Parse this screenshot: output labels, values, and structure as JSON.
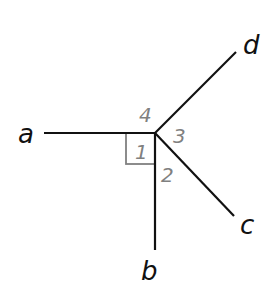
{
  "diagram": {
    "type": "angles-at-point",
    "vertex": {
      "x": 155,
      "y": 133
    },
    "rays": [
      {
        "id": "a",
        "label": "a",
        "end": {
          "x": 44,
          "y": 133
        }
      },
      {
        "id": "b",
        "label": "b",
        "end": {
          "x": 155,
          "y": 250
        }
      },
      {
        "id": "c",
        "label": "c",
        "end": {
          "x": 234,
          "y": 216
        }
      },
      {
        "id": "d",
        "label": "d",
        "end": {
          "x": 236,
          "y": 52
        }
      }
    ],
    "angles": [
      {
        "id": "1",
        "label": "1",
        "between": [
          "a",
          "b"
        ],
        "right_angle": true
      },
      {
        "id": "2",
        "label": "2",
        "between": [
          "b",
          "c"
        ]
      },
      {
        "id": "3",
        "label": "3",
        "between": [
          "c",
          "d"
        ]
      },
      {
        "id": "4",
        "label": "4",
        "between": [
          "d",
          "a"
        ]
      }
    ],
    "colors": {
      "ray": "#111111",
      "angle_label": "#808080",
      "right_angle_marker": "#808080",
      "background": "#ffffff"
    }
  }
}
